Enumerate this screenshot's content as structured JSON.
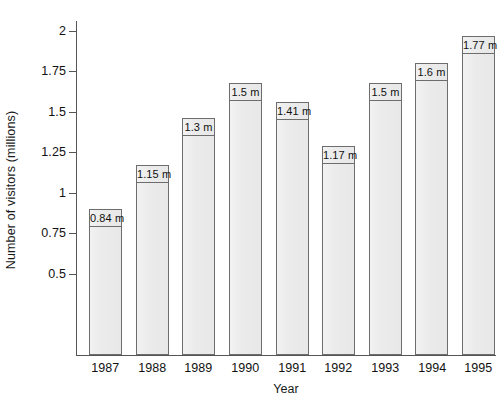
{
  "chart_data": {
    "type": "bar",
    "title": "",
    "xlabel": "Year",
    "ylabel": "Number of visitors (millions)",
    "categories": [
      "1987",
      "1988",
      "1989",
      "1990",
      "1991",
      "1992",
      "1993",
      "1994",
      "1995"
    ],
    "values": [
      0.84,
      1.15,
      1.3,
      1.5,
      1.41,
      1.17,
      1.5,
      1.6,
      1.77
    ],
    "value_labels": [
      "0.84 m",
      "1.15 m",
      "1.3 m",
      "1.5 m",
      "1.41 m",
      "1.17 m",
      "1.5 m",
      "1.6 m",
      "1.77 m"
    ],
    "bar_drawn_tops": [
      0.9,
      1.17,
      1.46,
      1.68,
      1.56,
      1.29,
      1.68,
      1.8,
      1.97
    ],
    "ylim": [
      0,
      2.08
    ],
    "yticks": [
      0.5,
      0.75,
      1,
      1.25,
      1.5,
      1.75,
      2
    ],
    "ytick_labels": [
      "0.5",
      "0.75",
      "1",
      "1.25",
      "1.5",
      "1.75",
      "2"
    ],
    "grid": false,
    "legend": null,
    "bar_fill_color": "#ebebeb",
    "bar_border_color": "#6d6d6d",
    "axis_color": "#555555",
    "text_color": "#111111",
    "background_color": "#ffffff"
  },
  "axes": {
    "y_title": "Number of visitors (millions)",
    "x_title": "Year"
  }
}
